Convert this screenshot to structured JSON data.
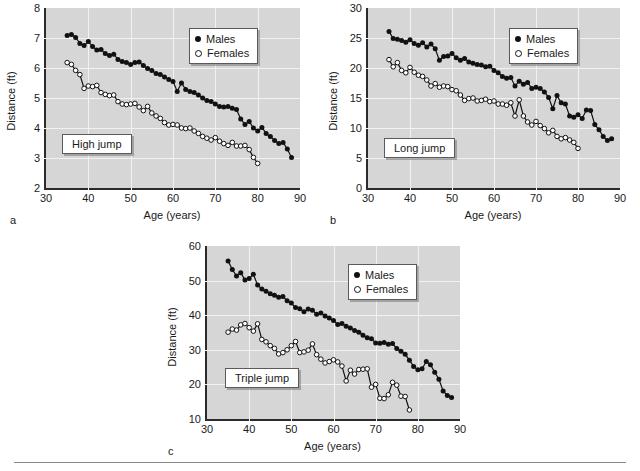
{
  "figure": {
    "background": "#ffffff",
    "plot_background": "#d6d6d6",
    "gridline_color": "#f2f2f2",
    "axis_color": "#2b2b2b",
    "series_color": "#111111"
  },
  "legend_common": {
    "males_label": "Males",
    "females_label": "Females"
  },
  "chart_data": [
    {
      "panel": "a",
      "type": "line",
      "title": "High jump",
      "xlabel": "Age (years)",
      "ylabel": "Distance (ft)",
      "xlim": [
        30,
        90
      ],
      "ylim": [
        2,
        8
      ],
      "xticks": [
        30,
        40,
        50,
        60,
        70,
        80,
        90
      ],
      "yticks": [
        2,
        3,
        4,
        5,
        6,
        7,
        8
      ],
      "grid": true,
      "legend_position": "top-right",
      "series": [
        {
          "name": "Males",
          "marker": "filled-circle",
          "x": [
            35,
            36,
            37,
            38,
            39,
            40,
            41,
            42,
            43,
            44,
            45,
            46,
            47,
            48,
            49,
            50,
            51,
            52,
            53,
            54,
            55,
            56,
            57,
            58,
            59,
            60,
            61,
            62,
            63,
            64,
            65,
            66,
            67,
            68,
            69,
            70,
            71,
            72,
            73,
            74,
            75,
            76,
            77,
            78,
            79,
            80,
            81,
            82,
            83,
            84,
            85,
            86,
            87,
            88
          ],
          "y": [
            7.08,
            7.12,
            7.02,
            6.82,
            6.75,
            6.88,
            6.72,
            6.6,
            6.62,
            6.48,
            6.42,
            6.46,
            6.28,
            6.22,
            6.18,
            6.12,
            6.18,
            6.2,
            6.08,
            5.98,
            5.92,
            5.82,
            5.78,
            5.7,
            5.62,
            5.55,
            5.22,
            5.5,
            5.28,
            5.22,
            5.18,
            5.1,
            5.0,
            4.92,
            4.88,
            4.8,
            4.72,
            4.7,
            4.72,
            4.66,
            4.62,
            4.3,
            4.12,
            4.22,
            4.0,
            3.9,
            4.02,
            3.82,
            3.72,
            3.58,
            3.48,
            3.52,
            3.3,
            3.02
          ]
        },
        {
          "name": "Females",
          "marker": "open-circle",
          "x": [
            35,
            36,
            37,
            38,
            39,
            40,
            41,
            42,
            43,
            44,
            45,
            46,
            47,
            48,
            49,
            50,
            51,
            52,
            53,
            54,
            55,
            56,
            57,
            58,
            59,
            60,
            61,
            62,
            63,
            64,
            65,
            66,
            67,
            68,
            69,
            70,
            71,
            72,
            73,
            74,
            75,
            76,
            77,
            78,
            79,
            80
          ],
          "y": [
            6.18,
            6.12,
            5.92,
            5.78,
            5.32,
            5.4,
            5.38,
            5.42,
            5.18,
            5.12,
            5.08,
            5.1,
            4.88,
            4.8,
            4.78,
            4.8,
            4.82,
            4.7,
            4.58,
            4.72,
            4.5,
            4.4,
            4.32,
            4.18,
            4.1,
            4.12,
            4.1,
            4.0,
            3.98,
            4.0,
            3.9,
            3.82,
            3.72,
            3.66,
            3.6,
            3.68,
            3.56,
            3.48,
            3.42,
            3.52,
            3.4,
            3.4,
            3.42,
            3.28,
            3.02,
            2.82
          ]
        }
      ]
    },
    {
      "panel": "b",
      "type": "line",
      "title": "Long jump",
      "xlabel": "Age (years)",
      "ylabel": "Distance (ft)",
      "xlim": [
        30,
        90
      ],
      "ylim": [
        0,
        30
      ],
      "xticks": [
        30,
        40,
        50,
        60,
        70,
        80,
        90
      ],
      "yticks": [
        0,
        5,
        10,
        15,
        20,
        25,
        30
      ],
      "grid": true,
      "legend_position": "top-right",
      "series": [
        {
          "name": "Males",
          "marker": "filled-circle",
          "x": [
            35,
            36,
            37,
            38,
            39,
            40,
            41,
            42,
            43,
            44,
            45,
            46,
            47,
            48,
            49,
            50,
            51,
            52,
            53,
            54,
            55,
            56,
            57,
            58,
            59,
            60,
            61,
            62,
            63,
            64,
            65,
            66,
            67,
            68,
            69,
            70,
            71,
            72,
            73,
            74,
            75,
            76,
            77,
            78,
            79,
            80,
            81,
            82,
            83,
            84,
            85,
            86,
            87,
            88
          ],
          "y": [
            26.1,
            24.9,
            24.8,
            24.6,
            24.3,
            24.7,
            24.1,
            23.8,
            24.2,
            23.5,
            24.0,
            23.2,
            21.3,
            21.9,
            22.0,
            22.4,
            21.7,
            21.3,
            21.6,
            21.0,
            20.8,
            20.6,
            20.5,
            20.2,
            20.3,
            19.6,
            19.2,
            18.6,
            18.3,
            18.4,
            17.0,
            17.8,
            17.3,
            17.6,
            16.6,
            16.8,
            16.6,
            16.0,
            15.1,
            13.2,
            15.4,
            14.2,
            14.0,
            12.0,
            11.8,
            12.2,
            11.6,
            13.0,
            12.9,
            10.6,
            9.7,
            8.6,
            7.9,
            8.2
          ]
        },
        {
          "name": "Females",
          "marker": "open-circle",
          "x": [
            35,
            36,
            37,
            38,
            39,
            40,
            41,
            42,
            43,
            44,
            45,
            46,
            47,
            48,
            49,
            50,
            51,
            52,
            53,
            54,
            55,
            56,
            57,
            58,
            59,
            60,
            61,
            62,
            63,
            64,
            65,
            66,
            67,
            68,
            69,
            70,
            71,
            72,
            73,
            74,
            75,
            76,
            77,
            78,
            79,
            80
          ],
          "y": [
            21.4,
            20.2,
            20.9,
            19.6,
            19.2,
            20.1,
            19.3,
            18.8,
            18.6,
            18.0,
            17.0,
            17.4,
            16.8,
            17.0,
            16.9,
            16.4,
            16.2,
            15.5,
            14.6,
            14.9,
            15.0,
            14.5,
            14.6,
            14.8,
            14.4,
            14.5,
            14.0,
            14.0,
            13.8,
            14.2,
            12.0,
            14.7,
            12.0,
            11.0,
            10.5,
            11.1,
            10.4,
            9.9,
            9.2,
            9.6,
            8.6,
            8.2,
            8.4,
            8.0,
            7.6,
            6.6
          ]
        }
      ]
    },
    {
      "panel": "c",
      "type": "line",
      "title": "Triple jump",
      "xlabel": "Age (years)",
      "ylabel": "Distance (ft)",
      "xlim": [
        30,
        90
      ],
      "ylim": [
        10,
        60
      ],
      "xticks": [
        30,
        40,
        50,
        60,
        70,
        80,
        90
      ],
      "yticks": [
        10,
        20,
        30,
        40,
        50,
        60
      ],
      "grid": true,
      "legend_position": "top-right",
      "series": [
        {
          "name": "Males",
          "marker": "filled-circle",
          "x": [
            35,
            36,
            37,
            38,
            39,
            40,
            41,
            42,
            43,
            44,
            45,
            46,
            47,
            48,
            49,
            50,
            51,
            52,
            53,
            54,
            55,
            56,
            57,
            58,
            59,
            60,
            61,
            62,
            63,
            64,
            65,
            66,
            67,
            68,
            69,
            70,
            71,
            72,
            73,
            74,
            75,
            76,
            77,
            78,
            79,
            80,
            81,
            82,
            83,
            84,
            85,
            86,
            87,
            88
          ],
          "y": [
            55.7,
            53.2,
            51.3,
            52.3,
            50.2,
            50.6,
            51.8,
            48.7,
            47.6,
            46.9,
            46.2,
            45.8,
            45.2,
            45.4,
            44.2,
            43.5,
            42.2,
            41.9,
            41.0,
            41.8,
            41.4,
            40.3,
            40.6,
            39.8,
            39.2,
            38.5,
            37.3,
            37.6,
            36.8,
            36.3,
            35.6,
            35.1,
            34.2,
            33.5,
            33.2,
            32.0,
            31.9,
            32.1,
            31.6,
            31.8,
            30.4,
            29.6,
            28.7,
            27.0,
            25.2,
            24.2,
            24.5,
            26.6,
            25.7,
            23.5,
            21.5,
            18.1,
            16.8,
            16.2
          ]
        },
        {
          "name": "Females",
          "marker": "open-circle",
          "x": [
            35,
            36,
            37,
            38,
            39,
            40,
            41,
            42,
            43,
            44,
            45,
            46,
            47,
            48,
            49,
            50,
            51,
            52,
            53,
            54,
            55,
            56,
            57,
            58,
            59,
            60,
            61,
            62,
            63,
            64,
            65,
            66,
            67,
            68,
            69,
            70,
            71,
            72,
            73,
            74,
            75,
            76,
            77,
            78
          ],
          "y": [
            35.1,
            36.0,
            35.7,
            37.2,
            37.6,
            36.4,
            35.4,
            37.5,
            33.0,
            32.3,
            31.2,
            30.4,
            28.8,
            29.2,
            30.0,
            31.2,
            32.4,
            29.2,
            29.4,
            29.9,
            31.7,
            28.6,
            27.3,
            26.2,
            26.6,
            27.1,
            26.5,
            25.3,
            21.0,
            24.1,
            23.0,
            24.3,
            24.4,
            24.5,
            19.2,
            20.0,
            16.0,
            15.9,
            17.0,
            20.6,
            19.8,
            16.6,
            16.5,
            12.6
          ]
        }
      ]
    }
  ]
}
